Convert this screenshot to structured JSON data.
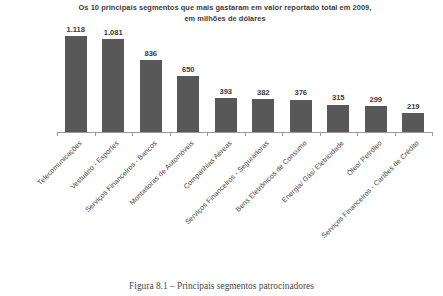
{
  "chart_data": {
    "type": "bar",
    "title": "Os 10 principais segmentos que mais gastaram em valor reportado total em 2009, em milhões de dólares",
    "title_line1": "Os 10 principais segmentos que mais gastaram em valor reportado total em 2009,",
    "title_line2": "em milhões de dólares",
    "xlabel": "",
    "ylabel": "",
    "ylim": [
      0,
      1200
    ],
    "grid": false,
    "legend": "none",
    "bar_color": "#585858",
    "axis_color": "#9a9a9a",
    "categories": [
      "Telecomunicações",
      "Vestuário - Esportes",
      "Serviços Financeiros - Bancos",
      "Montadoras de Automóveis",
      "Companhias Aéreas",
      "Serviços Financeiros - Seguradoras",
      "Bens Eletrônicos de Consumo",
      "Energia/ Gás/ Eletricidade",
      "Óleo/ Petróleo",
      "Serviços Financeiros - Cartões de Crédito"
    ],
    "values": [
      1118,
      1081,
      836,
      650,
      393,
      382,
      376,
      315,
      299,
      219
    ],
    "value_labels": [
      "1.118",
      "1.081",
      "836",
      "650",
      "393",
      "382",
      "376",
      "315",
      "299",
      "219"
    ]
  },
  "caption": {
    "text": "Figura 8.1 – Principais segmentos patrocinadores"
  }
}
